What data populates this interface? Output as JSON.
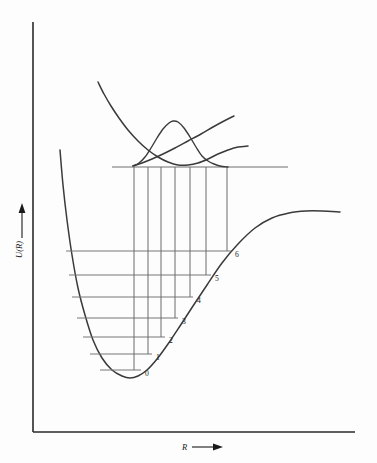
{
  "figure": {
    "axes": {
      "y_label": "U(R)",
      "x_label": "R",
      "y_axis_x": 33,
      "y_axis_top": 22,
      "y_axis_bottom": 432,
      "x_axis_left": 33,
      "x_axis_right": 355,
      "arrow_marker": "arrow-right"
    },
    "colors": {
      "curve": "#3a3a3a",
      "level": "#777777",
      "transition": "#6a6a6a",
      "axis": "#2a2a2a",
      "text": "#1a1a1a",
      "background": "#fdfdfd"
    }
  },
  "chart_data": {
    "type": "line",
    "xlabel": "R",
    "ylabel": "U(R)",
    "grid": false,
    "legend": "none",
    "xlim": [
      33,
      355
    ],
    "ylim": [
      432,
      22
    ],
    "series": [
      {
        "name": "ground-state-morse-curve",
        "role": "lower potential energy curve",
        "points": [
          [
            60,
            150
          ],
          [
            63,
            185
          ],
          [
            67,
            220
          ],
          [
            72,
            255
          ],
          [
            78,
            288
          ],
          [
            85,
            315
          ],
          [
            93,
            340
          ],
          [
            102,
            358
          ],
          [
            112,
            370
          ],
          [
            122,
            376
          ],
          [
            130,
            378
          ],
          [
            138,
            376
          ],
          [
            147,
            370
          ],
          [
            157,
            359
          ],
          [
            168,
            344
          ],
          [
            180,
            326
          ],
          [
            193,
            306
          ],
          [
            207,
            285
          ],
          [
            222,
            263
          ],
          [
            238,
            244
          ],
          [
            255,
            228
          ],
          [
            272,
            218
          ],
          [
            289,
            213
          ],
          [
            306,
            211
          ],
          [
            322,
            211
          ],
          [
            340,
            212
          ]
        ]
      },
      {
        "name": "excited-state-bound-curve",
        "role": "upper potential energy curve",
        "points": [
          [
            98,
            82
          ],
          [
            104,
            94
          ],
          [
            111,
            106
          ],
          [
            119,
            118
          ],
          [
            128,
            130
          ],
          [
            138,
            141
          ],
          [
            148,
            150
          ],
          [
            158,
            157
          ],
          [
            168,
            162
          ],
          [
            178,
            165
          ],
          [
            188,
            165
          ],
          [
            198,
            163
          ],
          [
            208,
            159
          ],
          [
            218,
            154
          ],
          [
            228,
            150
          ],
          [
            238,
            147
          ],
          [
            248,
            146
          ]
        ]
      },
      {
        "name": "repulsive-crossing-curve",
        "role": "upper repulsive curve crossing the bound state",
        "points": [
          [
            133,
            166
          ],
          [
            142,
            163
          ],
          [
            152,
            159
          ],
          [
            163,
            154
          ],
          [
            175,
            148
          ],
          [
            188,
            141
          ],
          [
            201,
            134
          ],
          [
            213,
            127
          ],
          [
            224,
            121
          ],
          [
            234,
            116
          ]
        ]
      },
      {
        "name": "excited-state-wavefunction",
        "role": "vibrational probability density in upper well",
        "points": [
          [
            133,
            166
          ],
          [
            139,
            163
          ],
          [
            145,
            157
          ],
          [
            151,
            148
          ],
          [
            157,
            138
          ],
          [
            163,
            129
          ],
          [
            169,
            123
          ],
          [
            173,
            121
          ],
          [
            178,
            122
          ],
          [
            184,
            128
          ],
          [
            190,
            137
          ],
          [
            196,
            147
          ],
          [
            202,
            156
          ],
          [
            208,
            161
          ],
          [
            214,
            164
          ],
          [
            220,
            166
          ],
          [
            228,
            167
          ]
        ]
      }
    ],
    "upper_level": {
      "name": "excited-state-level",
      "y": 167,
      "x_start": 112,
      "x_end": 288
    },
    "vibrational_levels": [
      {
        "label": "0",
        "v": 0,
        "y": 370,
        "x_start": 100,
        "x_end": 141,
        "label_x": 145,
        "label_y": 374
      },
      {
        "label": "1",
        "v": 1,
        "y": 354,
        "x_start": 90,
        "x_end": 152,
        "label_x": 156,
        "label_y": 358
      },
      {
        "label": "2",
        "v": 2,
        "y": 337,
        "x_start": 83,
        "x_end": 165,
        "label_x": 169,
        "label_y": 341
      },
      {
        "label": "3",
        "v": 3,
        "y": 318,
        "x_start": 77,
        "x_end": 178,
        "label_x": 182,
        "label_y": 322
      },
      {
        "label": "4",
        "v": 4,
        "y": 297,
        "x_start": 72,
        "x_end": 193,
        "label_x": 197,
        "label_y": 301
      },
      {
        "label": "5",
        "v": 5,
        "y": 275,
        "x_start": 69,
        "x_end": 211,
        "label_x": 215,
        "label_y": 279
      },
      {
        "label": "6",
        "v": 6,
        "y": 251,
        "x_start": 66,
        "x_end": 231,
        "label_x": 235,
        "label_y": 255
      }
    ],
    "transition_lines": [
      {
        "name": "transition-to-v6",
        "x": 227,
        "y_top": 167,
        "y_bottom": 251
      },
      {
        "name": "transition-to-v5",
        "x": 206,
        "y_top": 167,
        "y_bottom": 275
      },
      {
        "name": "transition-to-v4",
        "x": 190,
        "y_top": 167,
        "y_bottom": 297
      },
      {
        "name": "transition-to-v3",
        "x": 175,
        "y_top": 167,
        "y_bottom": 318
      },
      {
        "name": "transition-to-v2",
        "x": 161,
        "y_top": 167,
        "y_bottom": 337
      },
      {
        "name": "transition-to-v1",
        "x": 148,
        "y_top": 167,
        "y_bottom": 354
      },
      {
        "name": "transition-to-v0",
        "x": 134,
        "y_top": 167,
        "y_bottom": 370
      }
    ]
  }
}
